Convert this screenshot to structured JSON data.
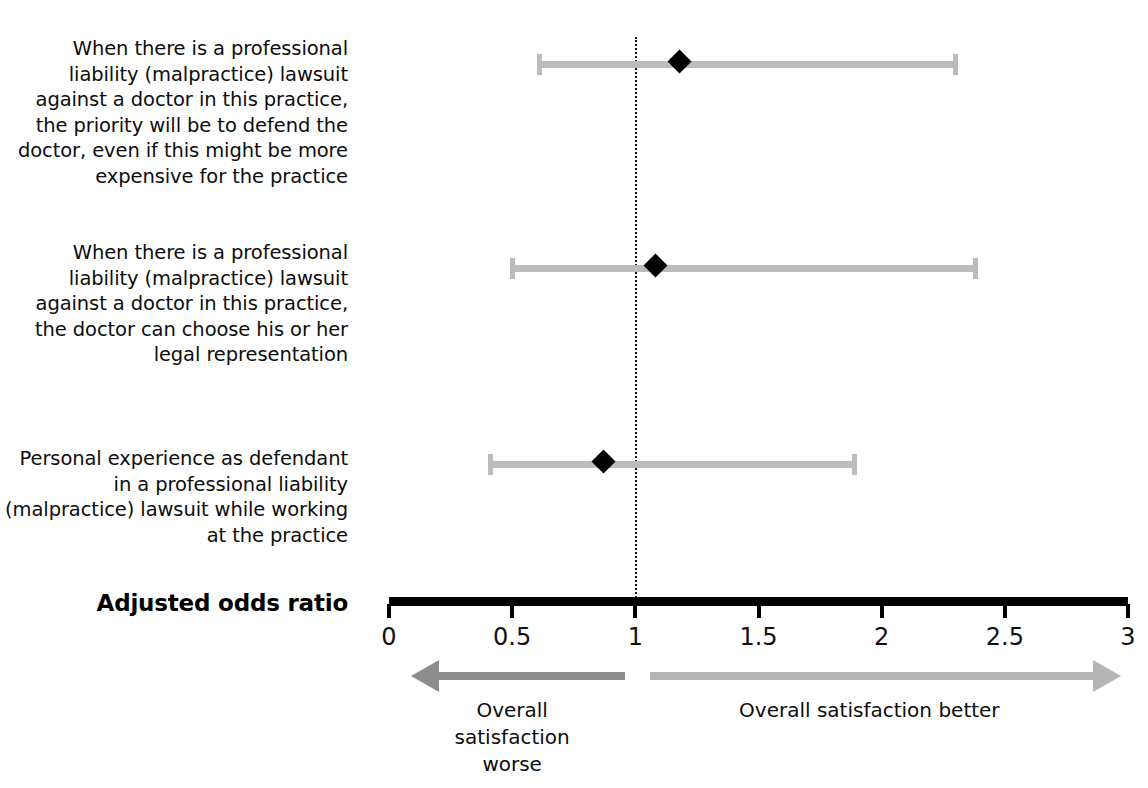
{
  "chart_data": {
    "type": "scatter",
    "plot_style": "forest-plot",
    "title": "",
    "xlabel": "Adjusted odds ratio",
    "ylabel": "",
    "xlim": [
      0,
      3
    ],
    "xticks": [
      0,
      0.5,
      1,
      1.5,
      2,
      2.5,
      3
    ],
    "xtick_labels": [
      "0",
      "0.5",
      "1",
      "1.5",
      "2",
      "2.5",
      "3"
    ],
    "grid": false,
    "reference_line": {
      "x": 1,
      "style": "dotted",
      "color": "#1a1a1a"
    },
    "categories": [
      "When there is a professional liability (malpractice) lawsuit against a doctor in this practice, the priority will be to defend the doctor, even if this might be more expensive for the practice",
      "When there is a professional liability (malpractice) lawsuit against a doctor in this practice, the doctor can choose his or her legal representation",
      "Personal experience as defendant in a professional liability (malpractice) lawsuit while working at the practice"
    ],
    "values": [
      1.18,
      1.08,
      0.87
    ],
    "ci_low": [
      0.6,
      0.49,
      0.4
    ],
    "ci_high": [
      2.31,
      2.39,
      1.9
    ],
    "marker": "diamond",
    "marker_color": "#000000",
    "ci_color": "#bcbcbc",
    "annotations": [
      {
        "text": "Overall satisfaction worse",
        "direction": "left",
        "from": 0.96,
        "to": 0.09,
        "color": "#8d8d8d"
      },
      {
        "text": "Overall satisfaction better",
        "direction": "right",
        "from": 1.06,
        "to": 2.97,
        "color": "#b5b5b5"
      }
    ]
  },
  "labels": {
    "rows": [
      "When there is a professional liability (malpractice) lawsuit against a doctor in this practice, the priority will be to defend the doctor, even if this might be more expensive for the practice",
      "When there is a professional liability (malpractice) lawsuit against a doctor in this practice, the doctor can choose his or her legal representation",
      "Personal experience as defendant in a professional liability (malpractice) lawsuit while working at the practice"
    ],
    "axis_title": "Adjusted odds ratio",
    "ticks": [
      "0",
      "0.5",
      "1",
      "1.5",
      "2",
      "2.5",
      "3"
    ],
    "caption_worse": "Overall satisfaction worse",
    "caption_better": "Overall satisfaction better"
  },
  "colors": {
    "ci": "#bcbcbc",
    "marker": "#000000",
    "axis": "#000000",
    "arrow_left": "#8d8d8d",
    "arrow_right": "#b5b5b5",
    "reference": "#1a1a1a",
    "text": "#0d0d0d"
  }
}
